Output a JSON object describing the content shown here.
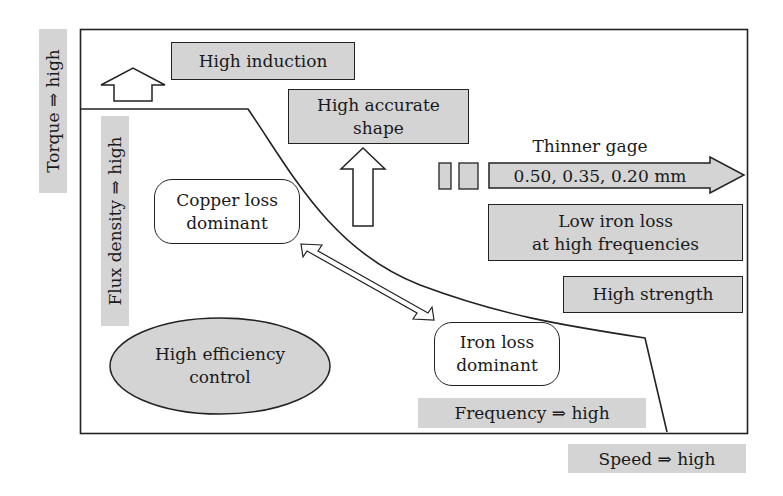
{
  "diagram": {
    "axes": {
      "y_outer": "Torque ⇒ high",
      "y_inner": "Flux density ⇒ high",
      "x_inner": "Frequency ⇒ high",
      "x_outer": "Speed ⇒ high"
    },
    "boxes": {
      "high_induction": "High induction",
      "high_accurate_shape_1": "High accurate",
      "high_accurate_shape_2": "shape",
      "thinner_gage_label": "Thinner gage",
      "thinner_gage_values": "0.50, 0.35, 0.20 mm",
      "low_iron_loss_1": "Low iron loss",
      "low_iron_loss_2": "at high frequencies",
      "high_strength": "High strength"
    },
    "regions": {
      "copper_loss_1": "Copper loss",
      "copper_loss_2": "dominant",
      "iron_loss_1": "Iron loss",
      "iron_loss_2": "dominant",
      "high_efficiency_1": "High efficiency",
      "high_efficiency_2": "control"
    },
    "colors": {
      "fill_grey": "#d4d4d4",
      "stroke": "#222222",
      "background": "#ffffff"
    }
  }
}
